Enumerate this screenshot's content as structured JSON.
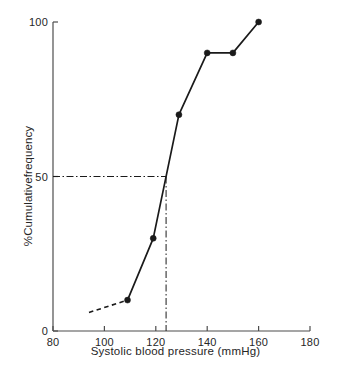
{
  "chart_data": {
    "type": "line",
    "title": "",
    "xlabel": "Systolic blood pressure (mmHg)",
    "ylabel": "%Cumulativefrequency",
    "xlim": [
      80,
      180
    ],
    "ylim": [
      0,
      100
    ],
    "xticks": [
      80,
      100,
      120,
      140,
      160,
      180
    ],
    "yticks": [
      0,
      50,
      100
    ],
    "xtick_labels": [
      "80",
      "100",
      "120",
      "140",
      "160",
      "180"
    ],
    "ytick_labels": [
      "0",
      "50",
      "100"
    ],
    "grid": false,
    "legend": null,
    "series": [
      {
        "name": "Cumulative frequency",
        "style": "solid-with-markers",
        "marker": "filled-circle",
        "color": "#1a1a1a",
        "x": [
          109,
          119,
          129,
          140,
          150,
          160
        ],
        "values": [
          10,
          30,
          70,
          90,
          90,
          100
        ]
      },
      {
        "name": "Extrapolated lower tail",
        "style": "dashed",
        "marker": "none",
        "color": "#1a1a1a",
        "x": [
          94,
          109
        ],
        "values": [
          6,
          10
        ]
      }
    ],
    "annotations": [
      {
        "name": "median-guide-horizontal",
        "style": "dash-dot",
        "from": {
          "x": 80,
          "y": 50
        },
        "to": {
          "x": 124,
          "y": 50
        },
        "label": ""
      },
      {
        "name": "median-guide-vertical",
        "style": "dash-dot",
        "from": {
          "x": 124,
          "y": 50
        },
        "to": {
          "x": 124,
          "y": 0
        },
        "label": ""
      }
    ],
    "median_estimate": 124
  }
}
